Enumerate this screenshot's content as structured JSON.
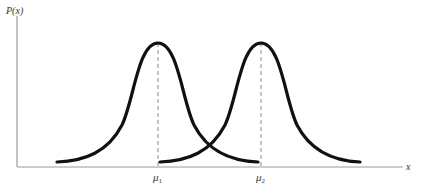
{
  "figure": {
    "y_axis_label": "P(x)",
    "x_axis_label": "x",
    "ticks": [
      {
        "label": "μ",
        "sub": "1"
      },
      {
        "label": "μ",
        "sub": "2"
      }
    ],
    "curves": [
      {
        "name": "distribution-1",
        "mean_label": "μ1",
        "shape": "bell (Lorentzian-like)"
      },
      {
        "name": "distribution-2",
        "mean_label": "μ2",
        "shape": "bell (Lorentzian-like)"
      }
    ],
    "colors": {
      "curve": "#111111",
      "axis": "#999999",
      "dashed": "#888888"
    }
  }
}
